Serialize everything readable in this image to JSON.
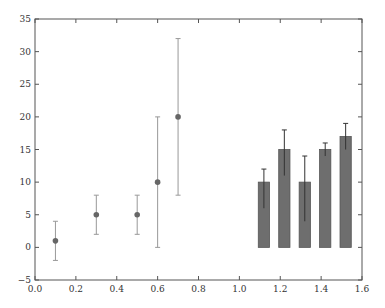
{
  "chart_data": {
    "type": "scatter+bar",
    "title": "",
    "xlabel": "",
    "ylabel": "",
    "xlim": [
      0.0,
      1.6
    ],
    "ylim": [
      -5,
      35
    ],
    "grid": false,
    "legend": null,
    "x_ticks": [
      "0.0",
      "0.2",
      "0.4",
      "0.6",
      "0.8",
      "1.0",
      "1.2",
      "1.4",
      "1.6"
    ],
    "y_ticks": [
      "−5",
      "0",
      "5",
      "10",
      "15",
      "20",
      "25",
      "30",
      "35"
    ],
    "series": [
      {
        "name": "points",
        "type": "errorbar-scatter",
        "color": "#666666",
        "x": [
          0.1,
          0.3,
          0.5,
          0.6,
          0.7
        ],
        "y": [
          1,
          5,
          5,
          10,
          20
        ],
        "err_low": [
          -2,
          2,
          2,
          0,
          8
        ],
        "err_high": [
          4,
          8,
          8,
          20,
          32
        ]
      },
      {
        "name": "bars",
        "type": "bar",
        "color": "#6e6e6e",
        "x": [
          1.12,
          1.22,
          1.32,
          1.42,
          1.52
        ],
        "width": 0.055,
        "values": [
          10,
          15,
          10,
          15,
          17
        ],
        "err_low": [
          6,
          11,
          4,
          14,
          15
        ],
        "err_high": [
          12,
          18,
          14,
          16,
          19
        ]
      }
    ]
  },
  "colors": {
    "axis": "#555555",
    "point": "#666666",
    "errorbar": "#999999",
    "bar_fill": "#6e6e6e",
    "bar_edge": "#555555",
    "bar_errorbar": "#333333"
  }
}
